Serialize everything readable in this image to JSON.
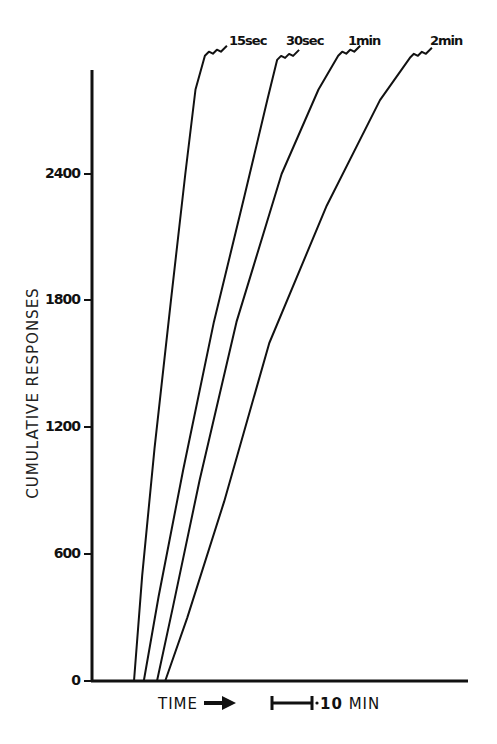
{
  "chart_data": {
    "type": "line",
    "title": "",
    "xlabel": "TIME",
    "ylabel": "CUMULATIVE RESPONSES",
    "x_scale_bar": {
      "label": "10 MIN",
      "value_min": 10
    },
    "y_ticks": [
      0,
      600,
      1200,
      1800,
      2400
    ],
    "ylim": [
      0,
      3000
    ],
    "grid": false,
    "legend_position": "direct labels at curve tops",
    "x_units": "minutes (estimated from 10-min scale bar)",
    "series": [
      {
        "name": "15sec",
        "x": [
          10.0,
          12.0,
          15.0,
          19.0,
          22.5,
          25.0,
          27.3
        ],
        "y": [
          0,
          500,
          1100,
          1800,
          2400,
          2800,
          2960
        ]
      },
      {
        "name": "30sec",
        "x": [
          12.4,
          16.0,
          22.0,
          29.5,
          37.0,
          42.5,
          44.9
        ],
        "y": [
          0,
          400,
          1000,
          1700,
          2300,
          2750,
          2940
        ]
      },
      {
        "name": "1min",
        "x": [
          15.6,
          19.5,
          26.0,
          35.0,
          46.0,
          55.0,
          59.8
        ],
        "y": [
          0,
          350,
          950,
          1700,
          2400,
          2800,
          2960
        ]
      },
      {
        "name": "2min",
        "x": [
          17.6,
          23.0,
          32.0,
          43.0,
          57.0,
          70.0,
          77.3
        ],
        "y": [
          0,
          300,
          850,
          1600,
          2250,
          2750,
          2950
        ]
      }
    ]
  },
  "labels": {
    "ylabel": "CUMULATIVE RESPONSES",
    "xlabel": "TIME",
    "scale_value": "10",
    "scale_unit": "MIN",
    "ticks": [
      "0",
      "600",
      "1200",
      "1800",
      "2400"
    ],
    "curves": [
      "15sec",
      "30sec",
      "1min",
      "2min"
    ]
  },
  "colors": {
    "ink": "#111111",
    "background": "#ffffff"
  }
}
